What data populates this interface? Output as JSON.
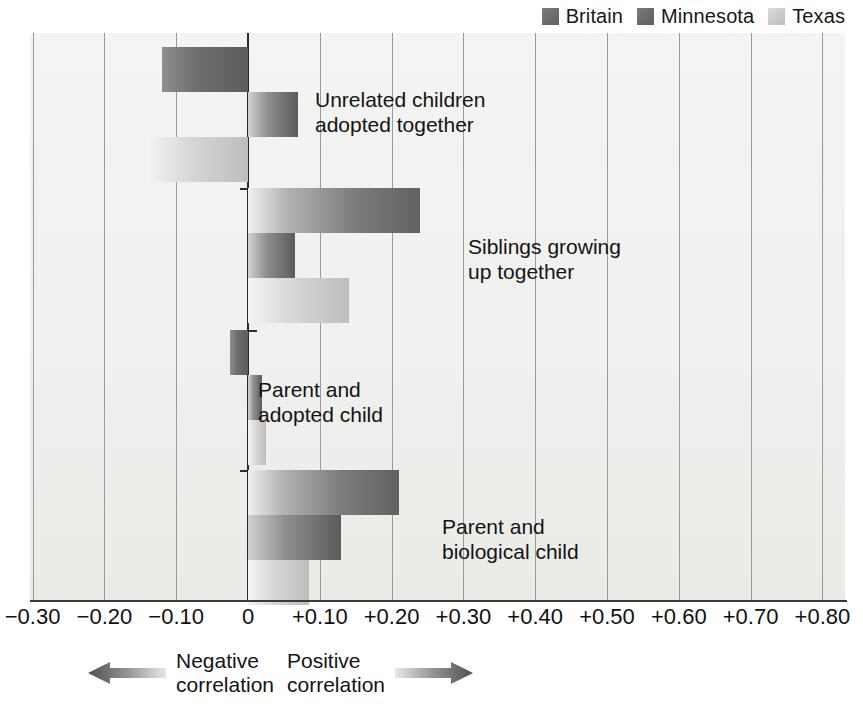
{
  "legend": {
    "items": [
      {
        "label": "Britain",
        "color": "#6e6e6c",
        "key": "britain"
      },
      {
        "label": "Minnesota",
        "color": "#6c6c6a",
        "key": "minnesota"
      },
      {
        "label": "Texas",
        "color": "#c9c9c7",
        "key": "texas"
      }
    ]
  },
  "footer": {
    "negative": {
      "label": "Negative\ncorrelation",
      "icon": "left-arrow-icon"
    },
    "positive": {
      "label": "Positive\ncorrelation",
      "icon": "right-arrow-icon"
    }
  },
  "axis": {
    "ticks": [
      {
        "label": "−0.30",
        "value": -0.3
      },
      {
        "label": "−0.20",
        "value": -0.2
      },
      {
        "label": "−0.10",
        "value": -0.1
      },
      {
        "label": "0",
        "value": 0.0
      },
      {
        "label": "+0.10",
        "value": 0.1
      },
      {
        "label": "+0.20",
        "value": 0.2
      },
      {
        "label": "+0.30",
        "value": 0.3
      },
      {
        "label": "+0.40",
        "value": 0.4
      },
      {
        "label": "+0.50",
        "value": 0.5
      },
      {
        "label": "+0.60",
        "value": 0.6
      },
      {
        "label": "+0.70",
        "value": 0.7
      },
      {
        "label": "+0.80",
        "value": 0.8
      }
    ]
  },
  "chart_data": {
    "type": "bar",
    "orientation": "horizontal",
    "title": "",
    "xlabel": "",
    "ylabel": "",
    "xlim": [
      -0.3,
      0.8
    ],
    "grid": true,
    "legend_position": "top-right",
    "categories": [
      "Unrelated children\nadopted together",
      "Siblings growing\nup together",
      "Parent and\nadopted child",
      "Parent and\nbiological child"
    ],
    "series": [
      {
        "name": "Britain",
        "values": [
          -0.12,
          0.24,
          -0.025,
          0.21
        ]
      },
      {
        "name": "Minnesota",
        "values": [
          0.07,
          0.065,
          0.02,
          0.13
        ]
      },
      {
        "name": "Texas",
        "values": [
          -0.14,
          0.14,
          0.025,
          0.085
        ]
      }
    ]
  }
}
